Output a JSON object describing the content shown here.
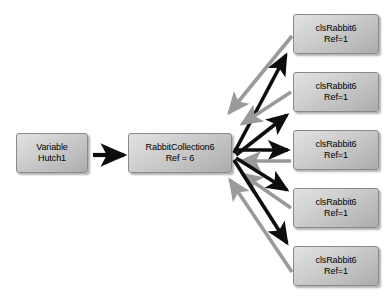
{
  "diagram": {
    "background_color": "#ffffff",
    "node_fill_color": "#c8c8c8",
    "forward_edge_color": "#000000",
    "back_edge_color": "#9a9a9a",
    "variable_node": {
      "line1": "Variable",
      "line2": "Hutch1"
    },
    "collection_node": {
      "line1": "RabbitCollection6",
      "line2": "Ref = 6"
    },
    "item_nodes": [
      {
        "line1": "clsRabbit6",
        "line2": "Ref=1"
      },
      {
        "line1": "clsRabbit6",
        "line2": "Ref=1"
      },
      {
        "line1": "clsRabbit6",
        "line2": "Ref=1"
      },
      {
        "line1": "clsRabbit6",
        "line2": "Ref=1"
      },
      {
        "line1": "clsRabbit6",
        "line2": "Ref=1"
      }
    ],
    "edges": {
      "variable_to_collection": "Variable Hutch1 references RabbitCollection6",
      "collection_to_items": "RabbitCollection6 references each clsRabbit6",
      "items_to_collection": "each clsRabbit6 references back to RabbitCollection6"
    }
  }
}
